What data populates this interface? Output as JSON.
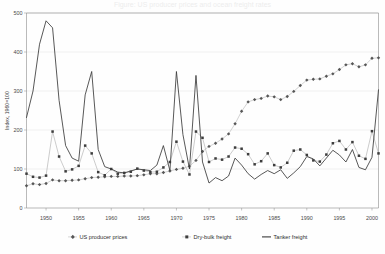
{
  "chart_title": "Figure: US producer prices and ocean freight rates",
  "axes": {
    "y_axis_title": "Index, 1960=100",
    "y_ticks": [
      "0",
      "100",
      "200",
      "300",
      "400",
      "500"
    ],
    "x_ticks": [
      "1950",
      "1955",
      "1960",
      "1965",
      "1970",
      "1975",
      "1980",
      "1985",
      "1990",
      "1995",
      "2000"
    ]
  },
  "legend": {
    "items": [
      {
        "label": "US producer prices",
        "marker": "diamond",
        "color": "#565656"
      },
      {
        "label": "Dry-bulk freight",
        "marker": "square",
        "color": "#3d3d3d"
      },
      {
        "label": "Tanker freight",
        "marker": "line",
        "color": "#3a3a3a"
      }
    ]
  },
  "chart_data": {
    "type": "line",
    "title": "Figure: US producer prices and ocean freight rates",
    "xlabel": "",
    "ylabel": "Index, 1960=100",
    "xlim": [
      1947,
      2001
    ],
    "ylim": [
      0,
      500
    ],
    "grid": true,
    "legend_position": "bottom",
    "x": [
      1947,
      1948,
      1949,
      1950,
      1951,
      1952,
      1953,
      1954,
      1955,
      1956,
      1957,
      1958,
      1959,
      1960,
      1961,
      1962,
      1963,
      1964,
      1965,
      1966,
      1967,
      1968,
      1969,
      1970,
      1971,
      1972,
      1973,
      1974,
      1975,
      1976,
      1977,
      1978,
      1979,
      1980,
      1981,
      1982,
      1983,
      1984,
      1985,
      1986,
      1987,
      1988,
      1989,
      1990,
      1991,
      1992,
      1993,
      1994,
      1995,
      1996,
      1997,
      1998,
      1999,
      2000,
      2001
    ],
    "series": [
      {
        "name": "US producer prices",
        "marker": "diamond",
        "color": "#565656",
        "values": [
          57,
          62,
          60,
          63,
          72,
          70,
          70,
          71,
          72,
          75,
          78,
          79,
          80,
          81,
          81,
          82,
          82,
          83,
          85,
          88,
          88,
          91,
          95,
          99,
          102,
          107,
          122,
          145,
          158,
          166,
          177,
          190,
          216,
          248,
          272,
          278,
          281,
          287,
          285,
          278,
          286,
          299,
          314,
          328,
          330,
          331,
          338,
          344,
          355,
          367,
          370,
          362,
          367,
          384,
          385
        ]
      },
      {
        "name": "Dry-bulk freight",
        "marker": "square",
        "color": "#3d3d3d",
        "values": [
          88,
          80,
          78,
          83,
          196,
          132,
          94,
          99,
          108,
          160,
          140,
          92,
          84,
          100,
          88,
          90,
          93,
          101,
          96,
          92,
          93,
          104,
          118,
          170,
          119,
          86,
          196,
          180,
          118,
          127,
          124,
          132,
          155,
          152,
          138,
          112,
          120,
          140,
          110,
          104,
          116,
          147,
          150,
          136,
          122,
          119,
          137,
          166,
          172,
          150,
          169,
          134,
          126,
          197,
          140
        ]
      },
      {
        "name": "Tanker freight",
        "marker": "line",
        "color": "#3a3a3a",
        "values": [
          232,
          300,
          420,
          480,
          462,
          276,
          160,
          128,
          120,
          290,
          350,
          150,
          106,
          100,
          92,
          90,
          95,
          100,
          98,
          96,
          110,
          160,
          96,
          350,
          188,
          100,
          340,
          118,
          64,
          78,
          70,
          82,
          128,
          110,
          88,
          74,
          86,
          96,
          88,
          98,
          76,
          90,
          106,
          132,
          126,
          108,
          128,
          148,
          136,
          118,
          150,
          104,
          98,
          130,
          303
        ]
      }
    ]
  }
}
